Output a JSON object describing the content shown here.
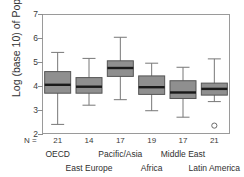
{
  "chart_data": {
    "type": "box",
    "title": "",
    "xlabel": "",
    "ylabel": "Log (base 10) of Population",
    "ylim": [
      2,
      7
    ],
    "yticks": [
      2,
      3,
      4,
      5,
      6,
      7
    ],
    "ytick_labels": [
      "2",
      "3",
      "4",
      "5",
      "6",
      "7"
    ],
    "grid": false,
    "legend": "none",
    "n_prefix": "N =",
    "categories": [
      "OECD",
      "East Europe",
      "Pacific/Asia",
      "Africa",
      "Middle East",
      "Latin America"
    ],
    "counts": [
      21,
      14,
      17,
      19,
      17,
      21
    ],
    "boxes": [
      {
        "category": "OECD",
        "n": 21,
        "whisker_low": 2.4,
        "q1": 3.7,
        "median": 4.05,
        "q3": 4.6,
        "whisker_high": 5.4,
        "outliers": []
      },
      {
        "category": "East Europe",
        "n": 14,
        "whisker_low": 3.2,
        "q1": 3.7,
        "median": 3.97,
        "q3": 4.35,
        "whisker_high": 5.15,
        "outliers": []
      },
      {
        "category": "Pacific/Asia",
        "n": 17,
        "whisker_low": 3.43,
        "q1": 4.4,
        "median": 4.75,
        "q3": 5.05,
        "whisker_high": 6.03,
        "outliers": []
      },
      {
        "category": "Africa",
        "n": 19,
        "whisker_low": 2.97,
        "q1": 3.65,
        "median": 3.95,
        "q3": 4.42,
        "whisker_high": 4.95,
        "outliers": []
      },
      {
        "category": "Middle East",
        "n": 17,
        "whisker_low": 2.7,
        "q1": 3.48,
        "median": 3.73,
        "q3": 4.22,
        "whisker_high": 4.78,
        "outliers": []
      },
      {
        "category": "Latin America",
        "n": 21,
        "whisker_low": 3.35,
        "q1": 3.62,
        "median": 3.88,
        "q3": 4.12,
        "whisker_high": 5.13,
        "outliers": [
          2.35
        ]
      }
    ],
    "colors": {
      "box_fill": "#8f8f8f",
      "box_edge": "#555555",
      "median": "#1a1a1a",
      "whisker": "#777777",
      "frame": "#9a9a9a",
      "outlier": "#6b6b6b",
      "text": "#2b2b2b",
      "background": "#ffffff"
    }
  }
}
